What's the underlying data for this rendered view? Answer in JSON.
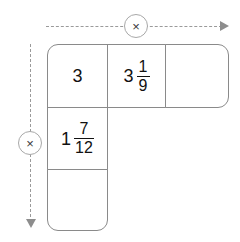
{
  "figure": {
    "shape": "L-shaped grid of five cells",
    "stroke_color": "#8a8a8a",
    "guide_color": "#9a9a9a",
    "text_color": "#111111",
    "background": "#ffffff"
  },
  "operators": {
    "row": {
      "symbol": "×",
      "icon": "multiply-icon",
      "direction": "right",
      "label": "multiply across row"
    },
    "column": {
      "symbol": "×",
      "icon": "multiply-icon",
      "direction": "down",
      "label": "multiply down column"
    }
  },
  "cells": [
    {
      "id": "a",
      "position": "top-row-1",
      "kind": "value",
      "whole": "3",
      "numerator": "",
      "denominator": "",
      "display": "3",
      "empty": false
    },
    {
      "id": "b",
      "position": "top-row-2",
      "kind": "mixed-number",
      "whole": "3",
      "numerator": "1",
      "denominator": "9",
      "display": "3 1/9",
      "empty": false
    },
    {
      "id": "c",
      "position": "top-row-3",
      "kind": "answer-box",
      "whole": "",
      "numerator": "",
      "denominator": "",
      "display": "",
      "empty": true
    },
    {
      "id": "d",
      "position": "left-column-2",
      "kind": "mixed-number",
      "whole": "1",
      "numerator": "7",
      "denominator": "12",
      "display": "1 7/12",
      "empty": false
    },
    {
      "id": "e",
      "position": "left-column-3",
      "kind": "answer-box",
      "whole": "",
      "numerator": "",
      "denominator": "",
      "display": "",
      "empty": true
    }
  ]
}
